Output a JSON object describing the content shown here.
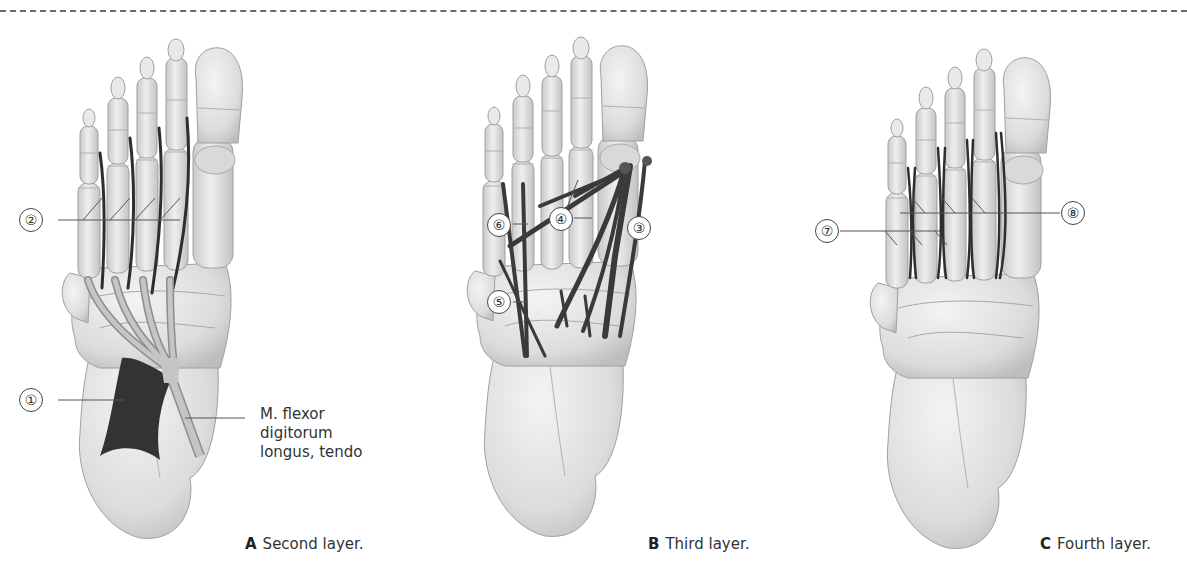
{
  "figure": {
    "panels": [
      {
        "id": "A",
        "letter": "A",
        "caption": "Second layer.",
        "labels": [
          "①",
          "②"
        ],
        "term_lines": [
          "M. flexor",
          "digitorum",
          "longus, tendo"
        ]
      },
      {
        "id": "B",
        "letter": "B",
        "caption": "Third layer.",
        "labels": [
          "③",
          "④",
          "⑤",
          "⑥"
        ]
      },
      {
        "id": "C",
        "letter": "C",
        "caption": "Fourth layer.",
        "labels": [
          "⑦",
          "⑧"
        ]
      }
    ],
    "colors": {
      "bone": "#e6e6e6",
      "bone_shade": "#c4c4c4",
      "bone_outline": "#9a9a9a",
      "muscle": "#3a3a3a",
      "tendon": "#b5b5b5",
      "leader_line": "#555555"
    }
  }
}
